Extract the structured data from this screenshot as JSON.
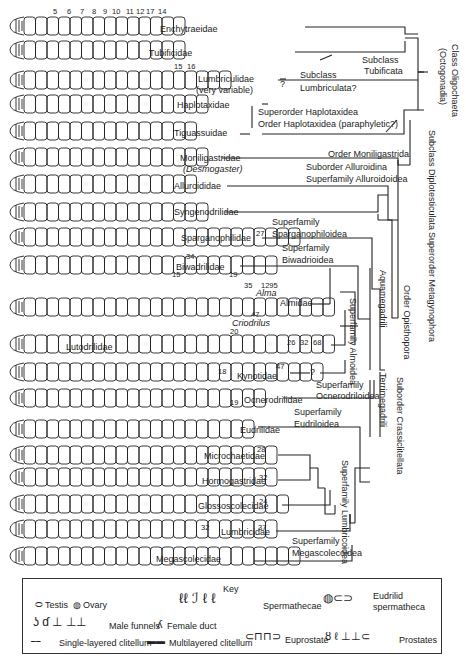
{
  "segment_numbers": [
    "5",
    "6",
    "7",
    "8",
    "9",
    "10",
    "11",
    "12",
    "17",
    "14"
  ],
  "families": [
    {
      "name": "Enchytraeidae",
      "y": 26
    },
    {
      "name": "Tubificidae",
      "y": 50
    },
    {
      "name": "Lumbriculidae",
      "sub": "(very variable)",
      "y": 80
    },
    {
      "name": "Haplotaxidae",
      "y": 104
    },
    {
      "name": "Tiguassuidae",
      "y": 131
    },
    {
      "name": "Moniligastridae",
      "sub": "(Desmogaster)",
      "y": 157
    },
    {
      "name": "Alluroididae",
      "y": 184
    },
    {
      "name": "Syngenodrilidae",
      "y": 212
    },
    {
      "name": "Sparganophilidae",
      "y": 237
    },
    {
      "name": "Biwadrilidae",
      "y": 265
    },
    {
      "name": "Almidae",
      "y": 307
    },
    {
      "name": "Lutodrilidae",
      "y": 344
    },
    {
      "name": "Kynotidae",
      "y": 372
    },
    {
      "name": "Ocnerodrilidae",
      "y": 398
    },
    {
      "name": "Eudrilidae",
      "y": 429
    },
    {
      "name": "Microchaetidae",
      "y": 455
    },
    {
      "name": "Hormogastridae",
      "y": 477
    },
    {
      "name": "Glossoscolecidae",
      "y": 504
    },
    {
      "name": "Lumbricidae",
      "y": 529
    },
    {
      "name": "Megascolecidae",
      "y": 556
    }
  ],
  "genus_labels": {
    "alma": "Alma",
    "criodrilus": "Criodrilus",
    "desmogaster": "(Desmogaster)"
  },
  "segment_callouts": [
    "15",
    "16",
    "27",
    "34",
    "15",
    "19",
    "35",
    "1295",
    "47",
    "20",
    "26",
    "32",
    "68",
    "18",
    "47",
    "19",
    "28",
    "32",
    "24",
    "32",
    "37"
  ],
  "taxa_labels": {
    "class": "Class Oligochaeta",
    "class_alt": "(Octogonadia)",
    "subclass_tubificata_1": "Subclass",
    "subclass_tubificata_2": "Tubificata",
    "subclass_lumbriculata_1": "Subclass",
    "subclass_lumbriculata_2": "Lumbriculata?",
    "superorder_haplotaxidea": "Superorder  Haplotaxidea",
    "order_haplotaxida": "Order  Haplotaxidea  (paraphyletic?)",
    "subclass_diplotesticulata": "Subclass Diplotesticulata",
    "order_moniligastrida": "Order Moniligastrida",
    "suborder_alluroidina": "Suborder Alluroidina",
    "superfamily_alluroidoidea": "Superfamily Alluroidoidea",
    "superorder_metagynophora": "Superorder Metagynophora",
    "superfamily_sparganophiloidea_1": "Superfamily",
    "superfamily_sparganophiloidea_2": "Sparganophiloidea",
    "superfamily_biwadrioidea_1": "Superfamily",
    "superfamily_biwadrioidea_2": "Biwadrioidea",
    "order_opisthopora": "Order Opisthopora",
    "aquamegadrili": "Aquamegadrili",
    "superfamily_almoidea": "Superfamily Almoidea",
    "terrimegadrili": "Terrimegadrili",
    "suborder_crassiclitellata": "Suborder Crassiclitellata",
    "superfamily_ocnerodriloidea_1": "Superfamily",
    "superfamily_ocnerodriloidea_2": "Ocnerodriloidea",
    "superfamily_eudriloidea_1": "Superfamily",
    "superfamily_eudriloidea_2": "Eudriloidea",
    "superfamily_lumbricoidea": "Superfamily Lumbricoidea",
    "superfamily_megascolecoidea_1": "Superfamily",
    "superfamily_megascolecoidea_2": "Megascolecoidea",
    "question": "?"
  },
  "key": {
    "title": "Key",
    "testis": "Testis",
    "ovary": "Ovary",
    "spermathecae": "Spermathecae",
    "eudrilid_spermatheca_1": "Eudrilid",
    "eudrilid_spermatheca_2": "spermatheca",
    "male_funnels": "Male funnels",
    "female_duct": "Female duct",
    "single_clitellum": "Single-layered clitellum",
    "multi_clitellum": "Multilayered clitellum",
    "euprostate": "Euprostate",
    "prostates": "Prostates"
  },
  "colors": {
    "ink": "#1a1a1a",
    "paper": "#ffffff"
  }
}
